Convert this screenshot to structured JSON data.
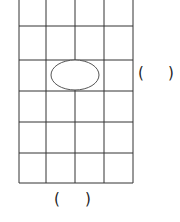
{
  "figure": {
    "type": "grid-with-shape",
    "grid": {
      "columns": 4,
      "rows_visible": 6,
      "vertical_lines_x": [
        19,
        46,
        75,
        104,
        133
      ],
      "horizontal_lines_y": [
        26,
        60,
        91,
        122,
        153,
        183
      ],
      "top_y": 0,
      "line_color": "#333333"
    },
    "shape": {
      "kind": "ellipse",
      "cx": 75,
      "cy": 75,
      "rx": 24,
      "ry": 15,
      "stroke": "#555555"
    },
    "answer_blanks": {
      "side": {
        "open": "(",
        "close": ")"
      },
      "bottom": {
        "open": "(",
        "close": ")"
      }
    }
  }
}
